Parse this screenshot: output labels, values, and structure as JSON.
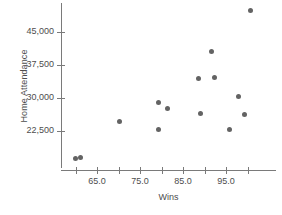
{
  "chart_data": {
    "type": "scatter",
    "title": "",
    "xlabel": "Wins",
    "ylabel": "Home Attendance",
    "xlim": [
      57.5,
      102.5
    ],
    "ylim": [
      14000,
      51500
    ],
    "grid": false,
    "legend": null,
    "x_ticks": [
      65.0,
      75.0,
      85.0,
      95.0
    ],
    "x_tick_labels": [
      "65.0",
      "75.0",
      "85.0",
      "95.0"
    ],
    "x_minor_ticks": [
      60.0,
      70.0,
      80.0,
      90.0,
      100.0
    ],
    "y_ticks": [
      22500,
      30000,
      37500,
      45000
    ],
    "y_tick_labels": [
      "22,500",
      "30,000",
      "37,500",
      "45,000"
    ],
    "point_color": "#636363",
    "axis_color": "#7a7a7a",
    "text_color": "#4d4d4d",
    "points": [
      {
        "x": 60.1,
        "y": 16350
      },
      {
        "x": 61.2,
        "y": 16580
      },
      {
        "x": 70.3,
        "y": 24770
      },
      {
        "x": 79.4,
        "y": 29080
      },
      {
        "x": 79.4,
        "y": 22950
      },
      {
        "x": 81.5,
        "y": 27720
      },
      {
        "x": 88.5,
        "y": 34330
      },
      {
        "x": 89.0,
        "y": 26580
      },
      {
        "x": 91.7,
        "y": 40500
      },
      {
        "x": 92.4,
        "y": 34550
      },
      {
        "x": 95.9,
        "y": 22950
      },
      {
        "x": 98.0,
        "y": 30450
      },
      {
        "x": 99.2,
        "y": 26350
      },
      {
        "x": 100.6,
        "y": 50000
      }
    ]
  }
}
